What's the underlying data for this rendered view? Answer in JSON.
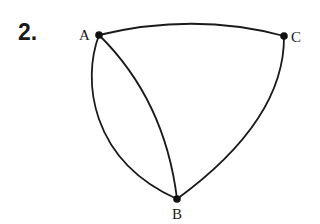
{
  "problem": {
    "number": "2."
  },
  "graph": {
    "vertices": [
      {
        "id": "A",
        "label": "A",
        "x": 99,
        "y": 35
      },
      {
        "id": "C",
        "label": "C",
        "x": 284,
        "y": 36
      },
      {
        "id": "B",
        "label": "B",
        "x": 177,
        "y": 199
      }
    ],
    "edges": [
      {
        "from": "A",
        "to": "C",
        "shape": "arc"
      },
      {
        "from": "A",
        "to": "B",
        "shape": "outer-arc"
      },
      {
        "from": "A",
        "to": "B",
        "shape": "inner-arc"
      },
      {
        "from": "C",
        "to": "B",
        "shape": "arc"
      }
    ],
    "vertex_labels": {
      "A": "A",
      "B": "B",
      "C": "C"
    }
  }
}
